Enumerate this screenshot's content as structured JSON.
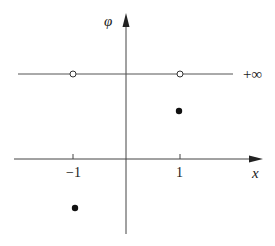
{
  "diagram": {
    "type": "function-graph",
    "axes": {
      "x_label": "x",
      "y_label": "φ",
      "x_ticks": [
        {
          "value": -1,
          "label": "−1"
        },
        {
          "value": 1,
          "label": "1"
        }
      ]
    },
    "horizontal_line": {
      "label": "+∞",
      "description": "line at φ = +∞"
    },
    "open_points": [
      {
        "x": -1,
        "y": "+∞"
      },
      {
        "x": 1,
        "y": "+∞"
      }
    ],
    "filled_points": [
      {
        "x": 1,
        "y": "positive"
      },
      {
        "x": -1,
        "y": "negative"
      }
    ],
    "colors": {
      "background": "#ffffff",
      "stroke": "#444444",
      "points": "#111111"
    }
  }
}
